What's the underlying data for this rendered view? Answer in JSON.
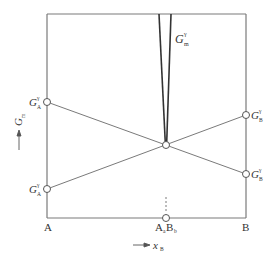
{
  "diagram": {
    "type": "free-energy-composition",
    "frame": {
      "left": 47,
      "right": 246,
      "top": 14,
      "bottom": 218
    },
    "colors": {
      "line": "#7a7a7a",
      "wedge": "#333333",
      "text": "#333333"
    },
    "y_axis": {
      "symbol": "G",
      "subscript": "m",
      "arrow": "↑"
    },
    "x_axis": {
      "arrow": "→",
      "symbol": "x",
      "subscript": "B"
    },
    "wedge_label": {
      "symbol": "G",
      "subscript": "m",
      "superscript": "γ"
    },
    "left_points": [
      {
        "symbol": "G",
        "subscript": "A",
        "superscript": "γ",
        "y": 102
      },
      {
        "symbol": "G",
        "subscript": "A",
        "superscript": "γ",
        "y": 189
      }
    ],
    "right_points": [
      {
        "symbol": "G",
        "subscript": "B",
        "superscript": "γ",
        "y": 115
      },
      {
        "symbol": "G",
        "subscript": "B",
        "superscript": "γ",
        "y": 174
      }
    ],
    "intersection": {
      "x": 166,
      "y": 145
    },
    "bottom_labels": {
      "left": "A",
      "right": "B",
      "middle": {
        "a": "A",
        "a_sub": "a",
        "b": "B",
        "b_sub": "b"
      }
    }
  }
}
